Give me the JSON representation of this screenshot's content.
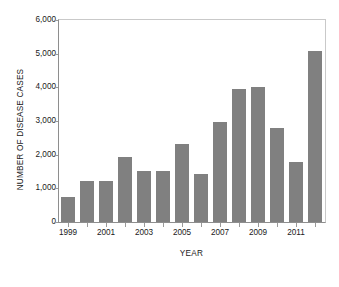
{
  "chart_data": {
    "type": "bar",
    "title": "",
    "xlabel": "YEAR",
    "ylabel": "NUMBER OF DISEASE CASES",
    "categories": [
      "1999",
      "2000",
      "2001",
      "2002",
      "2003",
      "2004",
      "2005",
      "2006",
      "2007",
      "2008",
      "2009",
      "2010",
      "2011",
      "2012"
    ],
    "values": [
      750,
      1220,
      1220,
      1940,
      1520,
      1520,
      2330,
      1420,
      2980,
      3940,
      4000,
      2800,
      1790,
      5090
    ],
    "ylim": [
      0,
      6000
    ],
    "ytick_values": [
      0,
      1000,
      2000,
      3000,
      4000,
      5000,
      6000
    ],
    "ytick_labels": [
      "0",
      "1,000",
      "2,000",
      "3,000",
      "4,000",
      "5,000",
      "6,000"
    ],
    "xtick_labels": [
      "1999",
      "2001",
      "2003",
      "2005",
      "2007",
      "2009",
      "2011"
    ],
    "xtick_categories": [
      "1999",
      "2001",
      "2003",
      "2005",
      "2007",
      "2009",
      "2011"
    ],
    "grid": false,
    "legend": false,
    "bar_color": "#808080",
    "background_color": "#ffffff",
    "axis_color": "#8e8e8e"
  }
}
